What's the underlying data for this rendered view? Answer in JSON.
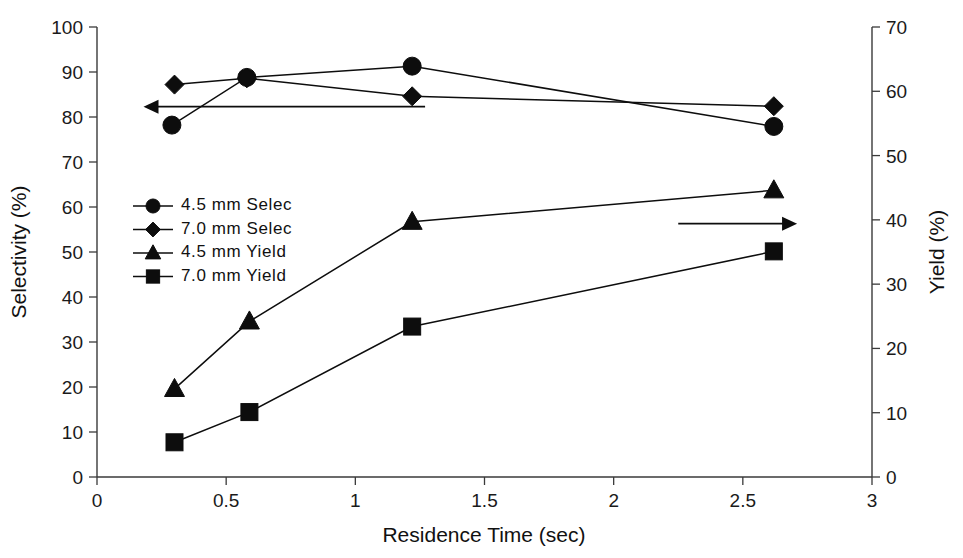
{
  "chart_data": {
    "type": "line",
    "title": "",
    "xlabel": "Residence Time (sec)",
    "ylabel": "Selectivity (%)",
    "y2label": "Yield (%)",
    "xlim": [
      0,
      3
    ],
    "ylim": [
      0,
      100
    ],
    "y2lim": [
      0,
      70
    ],
    "xticks": [
      "0",
      "0.5",
      "1",
      "1.5",
      "2",
      "2.5",
      "3"
    ],
    "xtick_values": [
      0,
      0.5,
      1,
      1.5,
      2,
      2.5,
      3
    ],
    "yticks": [
      "0",
      "10",
      "20",
      "30",
      "40",
      "50",
      "60",
      "70",
      "80",
      "90",
      "100"
    ],
    "ytick_values": [
      0,
      10,
      20,
      30,
      40,
      50,
      60,
      70,
      80,
      90,
      100
    ],
    "y2ticks": [
      "0",
      "10",
      "20",
      "30",
      "40",
      "50",
      "60",
      "70"
    ],
    "y2tick_values": [
      0,
      10,
      20,
      30,
      40,
      50,
      60,
      70
    ],
    "grid": false,
    "legend_position": "inside-left",
    "series": [
      {
        "name": "4.5 mm Selec",
        "marker": "circle",
        "axis": "left",
        "x": [
          0.29,
          0.58,
          1.22,
          2.62
        ],
        "values": [
          78.2,
          88.8,
          91.3,
          77.9
        ]
      },
      {
        "name": "7.0 mm Selec",
        "marker": "diamond",
        "axis": "left",
        "x": [
          0.3,
          0.58,
          1.22,
          2.62
        ],
        "values": [
          87.2,
          88.6,
          84.6,
          82.4
        ]
      },
      {
        "name": "4.5 mm Yield",
        "marker": "triangle",
        "axis": "right",
        "x": [
          0.3,
          0.59,
          1.22,
          2.62
        ],
        "values": [
          13.7,
          24.2,
          39.7,
          44.6
        ]
      },
      {
        "name": "7.0 mm Yield",
        "marker": "square",
        "axis": "right",
        "x": [
          0.3,
          0.59,
          1.22,
          2.62
        ],
        "values": [
          5.4,
          10.1,
          23.4,
          35.1
        ]
      }
    ],
    "annotations": [
      {
        "name": "left-axis-pointer",
        "type": "arrow",
        "direction": "left",
        "x_start": 1.27,
        "x_end": 0.18,
        "y_value": 82.3,
        "axis": "left"
      },
      {
        "name": "right-axis-pointer",
        "type": "arrow",
        "direction": "right",
        "x_start": 2.25,
        "x_end": 2.71,
        "y_value": 39.4,
        "axis": "right"
      }
    ]
  },
  "legend": {
    "entries": [
      {
        "label": "4.5 mm Selec",
        "marker": "circle"
      },
      {
        "label": "7.0 mm Selec",
        "marker": "diamond"
      },
      {
        "label": "4.5 mm Yield",
        "marker": "triangle"
      },
      {
        "label": "7.0 mm Yield",
        "marker": "square"
      }
    ]
  },
  "colors": {
    "ink": "#0d0d0d",
    "axis": "#3a3a3a",
    "background": "#ffffff"
  }
}
